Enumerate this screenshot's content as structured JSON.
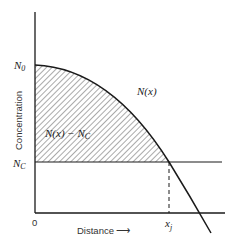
{
  "diagram": {
    "y_axis_label": "Concentration",
    "x_axis_label": "Distance",
    "x_axis_arrow": "⟶",
    "origin_label": "0",
    "n0_label": "N",
    "n0_sub": "0",
    "nc_label": "N",
    "nc_sub": "C",
    "curve_label": "N(x)",
    "shaded_region_label": "N(x) − N",
    "shaded_region_sub": "C",
    "junction_label": "x",
    "junction_sub": "j",
    "colors": {
      "line": "#1a1a1a",
      "hatch": "#555555",
      "background": "#ffffff"
    }
  }
}
